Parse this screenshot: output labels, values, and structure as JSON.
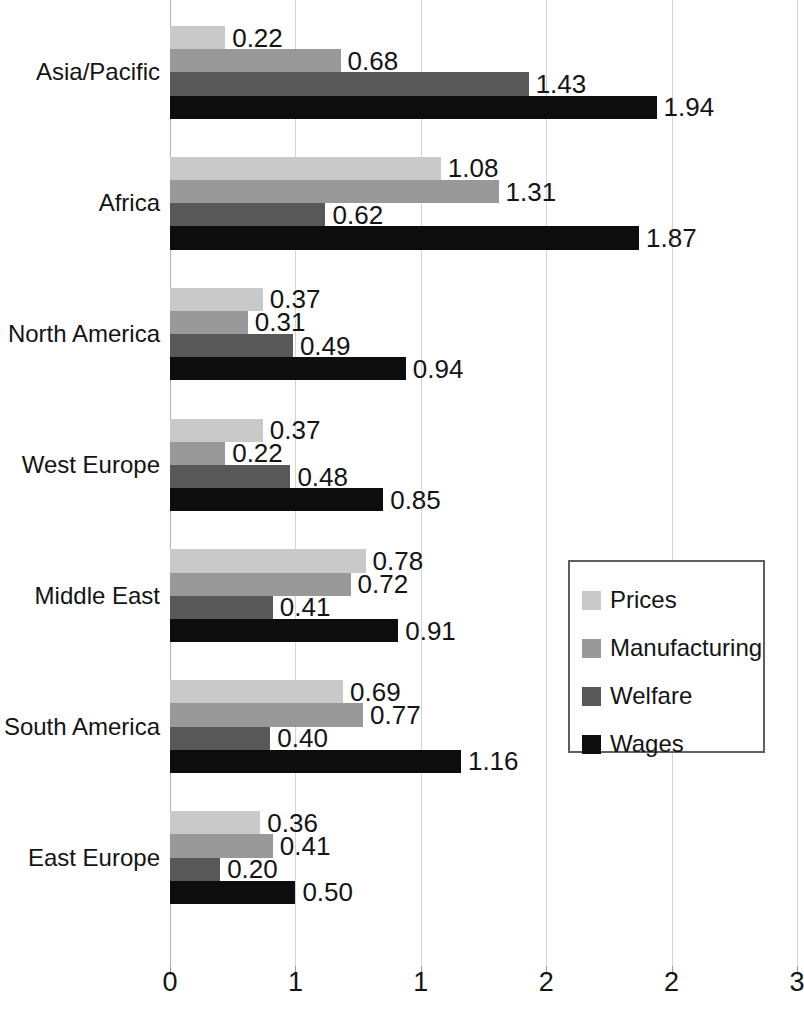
{
  "chart_data": {
    "type": "bar",
    "orientation": "horizontal",
    "title": "",
    "subtitle": "",
    "xlabel": "",
    "ylabel": "",
    "xlim": [
      0,
      2.5
    ],
    "grid": true,
    "grid_axis": "x",
    "legend_position": "right-middle",
    "value_label_format": "0.00",
    "categories": [
      "Asia/Pacific",
      "Africa",
      "North America",
      "West Europe",
      "Middle East",
      "South America",
      "East Europe"
    ],
    "series": [
      {
        "name": "Prices",
        "color": "#c9c9c9",
        "values": [
          0.22,
          1.08,
          0.37,
          0.37,
          0.78,
          0.69,
          0.36
        ],
        "labels": [
          "0.22",
          "1.08",
          "0.37",
          "0.37",
          "0.78",
          "0.69",
          "0.36"
        ]
      },
      {
        "name": "Manufacturing",
        "color": "#999999",
        "values": [
          0.68,
          1.31,
          0.31,
          0.22,
          0.72,
          0.77,
          0.41
        ],
        "labels": [
          "0.68",
          "1.31",
          "0.31",
          "0.22",
          "0.72",
          "0.77",
          "0.41"
        ]
      },
      {
        "name": "Welfare",
        "color": "#585858",
        "values": [
          1.43,
          0.62,
          0.49,
          0.48,
          0.41,
          0.4,
          0.2
        ],
        "labels": [
          "1.43",
          "0.62",
          "0.49",
          "0.48",
          "0.41",
          "0.40",
          "0.20"
        ]
      },
      {
        "name": "Wages",
        "color": "#0d0d0d",
        "values": [
          1.94,
          1.87,
          0.94,
          0.85,
          0.91,
          1.16,
          0.5
        ],
        "labels": [
          "1.94",
          "1.87",
          "0.94",
          "0.85",
          "0.91",
          "1.16",
          "0.50"
        ]
      }
    ],
    "x_ticks": [
      {
        "value": 0.0,
        "label": "0"
      },
      {
        "value": 0.5,
        "label": "1"
      },
      {
        "value": 1.0,
        "label": "1"
      },
      {
        "value": 1.5,
        "label": "2"
      },
      {
        "value": 2.0,
        "label": "2"
      },
      {
        "value": 2.5,
        "label": "3"
      }
    ],
    "legend_entries": [
      {
        "label": "Prices",
        "color": "#c9c9c9"
      },
      {
        "label": "Manufacturing",
        "color": "#999999"
      },
      {
        "label": "Welfare",
        "color": "#585858"
      },
      {
        "label": "Wages",
        "color": "#0d0d0d"
      }
    ]
  }
}
